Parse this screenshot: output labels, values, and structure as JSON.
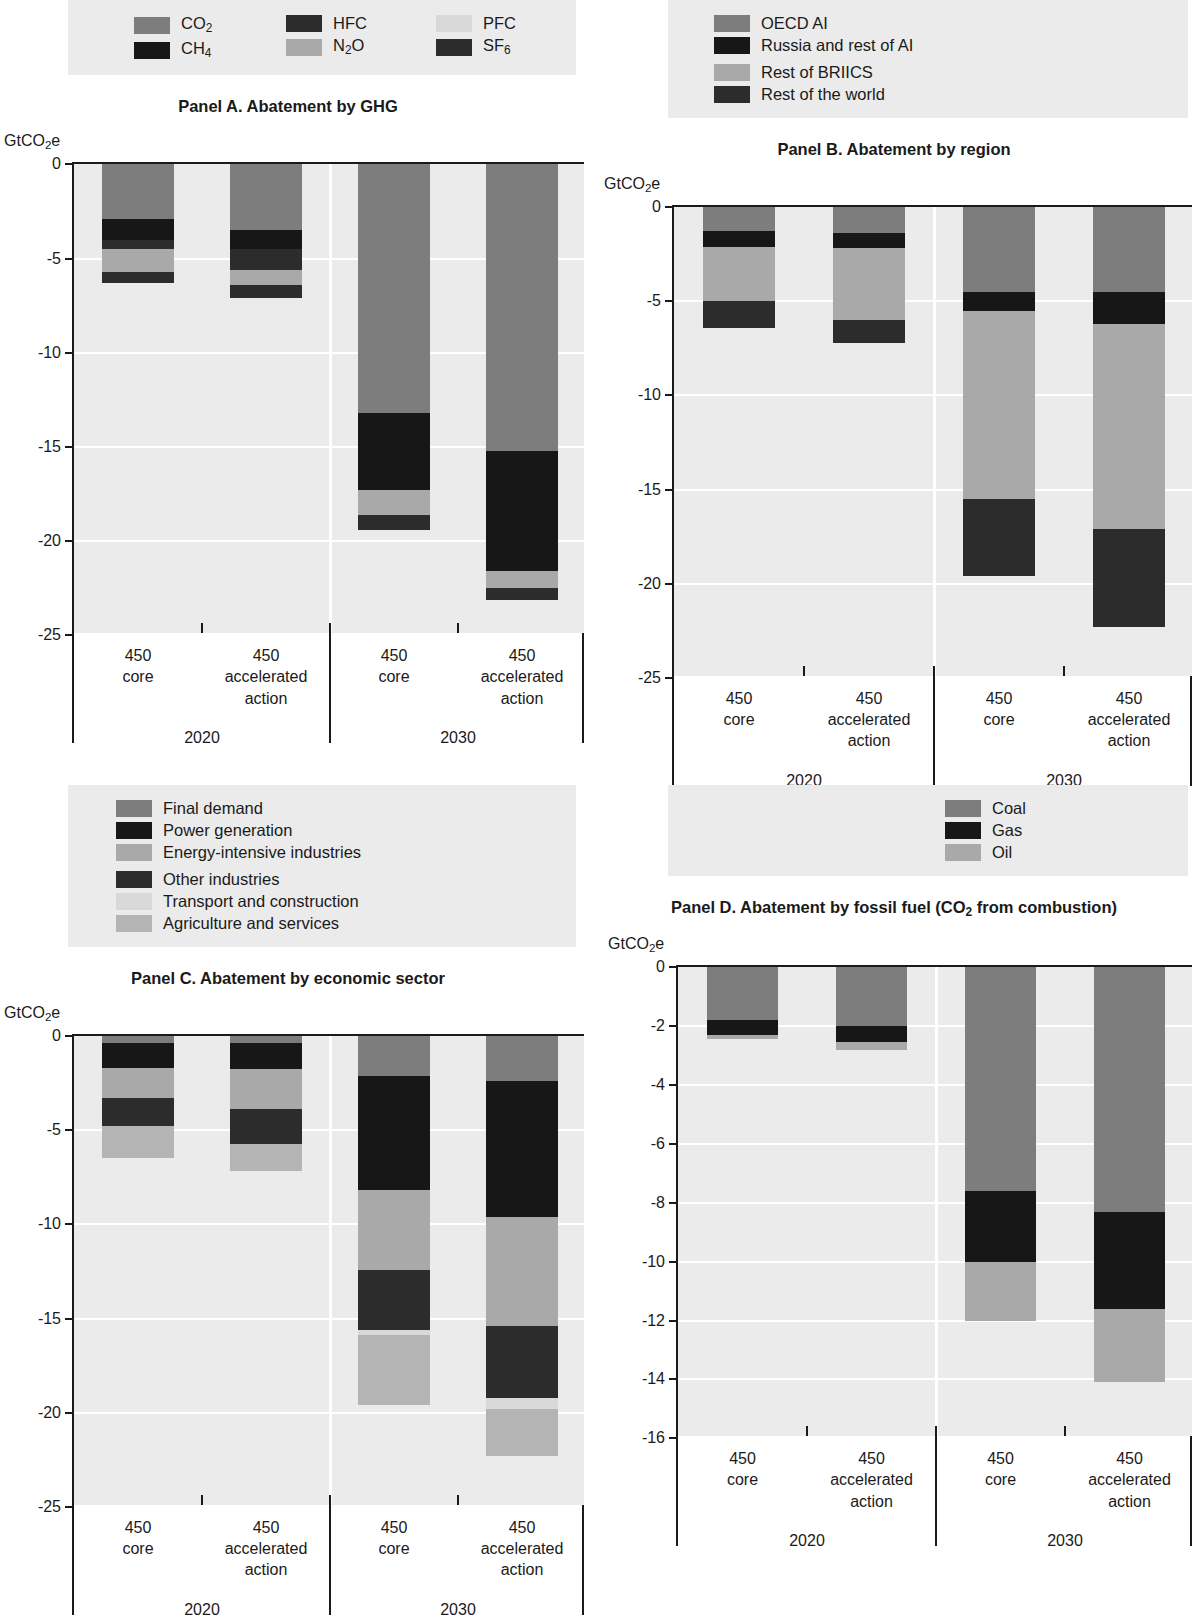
{
  "figure": {
    "y_axis_unit": "GtCO2e",
    "x_categories": [
      {
        "line1": "450",
        "line2": "core"
      },
      {
        "line1": "450",
        "line2": "accelerated",
        "line3": "action"
      },
      {
        "line1": "450",
        "line2": "core"
      },
      {
        "line1": "450",
        "line2": "accelerated",
        "line3": "action"
      }
    ],
    "x_groups": [
      "2020",
      "2030"
    ]
  },
  "colors": {
    "plot_background": "#ebebeb",
    "gridline": "#ffffff",
    "axis": "#1a1a1a",
    "dark_gray": "#7d7d7d",
    "mid_gray": "#909090",
    "light_gray": "#a9a9a9",
    "pale_gray": "#c4c4c4",
    "very_pale_gray": "#d8d8d8",
    "black": "#171717",
    "near_black": "#2c2c2c"
  },
  "chart_data": [
    {
      "id": "panel_a",
      "type": "bar",
      "title": "Panel A. Abatement by GHG",
      "ylabel": "GtCO2e",
      "xlabel": "",
      "ylim": [
        -25,
        0
      ],
      "yticks": [
        0,
        -5,
        -10,
        -15,
        -20,
        -25
      ],
      "grid": true,
      "legend_position": "top",
      "stacked": true,
      "categories": [
        "450 core 2020",
        "450 accelerated action 2020",
        "450 core 2030",
        "450 accelerated action 2030"
      ],
      "series": [
        {
          "name": "CO2",
          "label_html": "CO<sub>2</sub>",
          "color": "#7d7d7d",
          "values": [
            -2.9,
            -3.5,
            -13.2,
            -15.2
          ]
        },
        {
          "name": "CH4",
          "label_html": "CH<sub>4</sub>",
          "color": "#171717",
          "values": [
            -1.1,
            -1.0,
            -4.1,
            -6.4
          ]
        },
        {
          "name": "HFC",
          "label_html": "HFC",
          "color": "#2c2c2c",
          "values": [
            -0.5,
            -1.1,
            0.0,
            0.0
          ]
        },
        {
          "name": "N2O",
          "label_html": "N<sub>2</sub>O",
          "color": "#a9a9a9",
          "values": [
            -1.2,
            -0.8,
            -1.3,
            -0.9
          ]
        },
        {
          "name": "PFC",
          "label_html": "PFC",
          "color": "#d8d8d8",
          "values": [
            0.0,
            0.0,
            0.0,
            0.0
          ]
        },
        {
          "name": "SF6",
          "label_html": "SF<sub>6</sub>",
          "color": "#2c2c2c",
          "values": [
            -0.6,
            -0.7,
            -0.8,
            -0.6
          ]
        }
      ]
    },
    {
      "id": "panel_b",
      "type": "bar",
      "title": "Panel B. Abatement by region",
      "ylabel": "GtCO2e",
      "xlabel": "",
      "ylim": [
        -25,
        0
      ],
      "yticks": [
        0,
        -5,
        -10,
        -15,
        -20,
        -25
      ],
      "grid": true,
      "legend_position": "top",
      "stacked": true,
      "categories": [
        "450 core 2020",
        "450 accelerated action 2020",
        "450 core 2030",
        "450 accelerated action 2030"
      ],
      "series": [
        {
          "name": "OECD AI",
          "label_html": "OECD AI",
          "color": "#7d7d7d",
          "values": [
            -1.3,
            -1.4,
            -4.5,
            -4.5
          ]
        },
        {
          "name": "Russia and rest of AI",
          "label_html": "Russia and rest of AI",
          "color": "#171717",
          "values": [
            -0.8,
            -0.8,
            -1.0,
            -1.7
          ]
        },
        {
          "name": "Rest of BRIICS",
          "label_html": "Rest of BRIICS",
          "color": "#a9a9a9",
          "values": [
            -2.9,
            -3.8,
            -10.0,
            -10.9
          ]
        },
        {
          "name": "Rest of the world",
          "label_html": "Rest of the world",
          "color": "#2c2c2c",
          "values": [
            -1.4,
            -1.2,
            -4.1,
            -5.2
          ]
        }
      ]
    },
    {
      "id": "panel_c",
      "type": "bar",
      "title": "Panel C. Abatement by economic sector",
      "ylabel": "GtCO2e",
      "xlabel": "",
      "ylim": [
        -25,
        0
      ],
      "yticks": [
        0,
        -5,
        -10,
        -15,
        -20,
        -25
      ],
      "grid": true,
      "legend_position": "top",
      "stacked": true,
      "categories": [
        "450 core 2020",
        "450 accelerated action 2020",
        "450 core 2030",
        "450 accelerated action 2030"
      ],
      "series": [
        {
          "name": "Final demand",
          "label_html": "Final demand",
          "color": "#7d7d7d",
          "values": [
            -0.35,
            -0.35,
            -2.1,
            -2.4
          ]
        },
        {
          "name": "Power generation",
          "label_html": "Power generation",
          "color": "#171717",
          "values": [
            -1.35,
            -1.4,
            -6.1,
            -7.2
          ]
        },
        {
          "name": "Energy-intensive industries",
          "label_html": "Energy-intensive industries",
          "color": "#a9a9a9",
          "values": [
            -1.6,
            -2.1,
            -4.2,
            -5.8
          ]
        },
        {
          "name": "Other industries",
          "label_html": "Other industries",
          "color": "#2c2c2c",
          "values": [
            -1.5,
            -1.9,
            -3.2,
            -3.8
          ]
        },
        {
          "name": "Transport and construction",
          "label_html": "Transport and construction",
          "color": "#d8d8d8",
          "values": [
            0.0,
            0.0,
            -0.25,
            -0.6
          ]
        },
        {
          "name": "Agriculture and services",
          "label_html": "Agriculture and services",
          "color": "#b4b4b4",
          "values": [
            -1.7,
            -1.4,
            -3.75,
            -2.5
          ]
        }
      ]
    },
    {
      "id": "panel_d",
      "type": "bar",
      "title_html": "Panel D. Abatement by fossil fuel (CO<sub>2</sub> from combustion)",
      "title": "Panel D. Abatement by fossil fuel (CO2 from combustion)",
      "ylabel": "GtCO2e",
      "xlabel": "",
      "ylim": [
        -16,
        0
      ],
      "yticks": [
        0,
        -2,
        -4,
        -6,
        -8,
        -10,
        -12,
        -14,
        -16
      ],
      "grid": true,
      "legend_position": "top",
      "stacked": true,
      "categories": [
        "450 core 2020",
        "450 accelerated action 2020",
        "450 core 2030",
        "450 accelerated action 2030"
      ],
      "series": [
        {
          "name": "Coal",
          "label_html": "Coal",
          "color": "#7d7d7d",
          "values": [
            -1.8,
            -2.0,
            -7.6,
            -8.3
          ]
        },
        {
          "name": "Gas",
          "label_html": "Gas",
          "color": "#171717",
          "values": [
            -0.5,
            -0.55,
            -2.4,
            -3.3
          ]
        },
        {
          "name": "Oil",
          "label_html": "Oil",
          "color": "#a9a9a9",
          "values": [
            -0.15,
            -0.25,
            -2.0,
            -2.5
          ]
        }
      ]
    }
  ]
}
